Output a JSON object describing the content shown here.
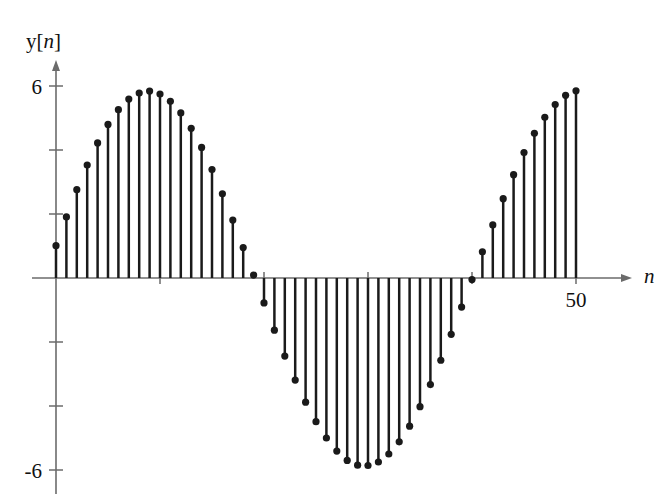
{
  "figure": {
    "title": "",
    "ylabel": "y[n]",
    "ylabel_prefix": "y[",
    "ylabel_var": "n",
    "ylabel_suffix": "]",
    "xlabel": "n",
    "ytick_top_label": "6",
    "ytick_bottom_label": "-6",
    "xtick_label": "50",
    "line_color": "#1a1a1a",
    "axis_color": "#6b6b6b",
    "background": "#ffffff"
  },
  "chart_data": {
    "type": "scatter",
    "subtype": "stem",
    "title": "",
    "xlabel": "n",
    "ylabel": "y[n]",
    "xlim": [
      0,
      53
    ],
    "ylim": [
      -6.6,
      6.6
    ],
    "grid": false,
    "legend": null,
    "xticks": [
      10,
      20,
      30,
      40,
      50
    ],
    "xtick_labels": [
      "",
      "",
      "",
      "",
      "50"
    ],
    "yticks": [
      -6,
      -4,
      -2,
      2,
      4,
      6
    ],
    "ytick_labels": [
      "-6",
      "",
      "",
      "",
      "",
      "6"
    ],
    "amplitude": 5.85,
    "period": 40,
    "phase_samples": 1.1,
    "x": [
      0,
      1,
      2,
      3,
      4,
      5,
      6,
      7,
      8,
      9,
      10,
      11,
      12,
      13,
      14,
      15,
      16,
      17,
      18,
      19,
      20,
      21,
      22,
      23,
      24,
      25,
      26,
      27,
      28,
      29,
      30,
      31,
      32,
      33,
      34,
      35,
      36,
      37,
      38,
      39,
      40,
      41,
      42,
      43,
      44,
      45,
      46,
      47,
      48,
      49,
      50
    ],
    "values": [
      1.01,
      1.91,
      2.76,
      3.53,
      4.22,
      4.8,
      5.26,
      5.59,
      5.78,
      5.84,
      5.75,
      5.52,
      5.16,
      4.68,
      4.08,
      3.39,
      2.63,
      1.81,
      0.95,
      0.09,
      -0.78,
      -1.63,
      -2.44,
      -3.19,
      -3.88,
      -4.49,
      -5.0,
      -5.41,
      -5.7,
      -5.85,
      -5.86,
      -5.75,
      -5.5,
      -5.12,
      -4.63,
      -4.02,
      -3.33,
      -2.57,
      -1.76,
      -0.91,
      -0.05,
      0.82,
      1.66,
      2.48,
      3.23,
      3.92,
      4.52,
      5.02,
      5.42,
      5.71,
      5.85
    ]
  }
}
